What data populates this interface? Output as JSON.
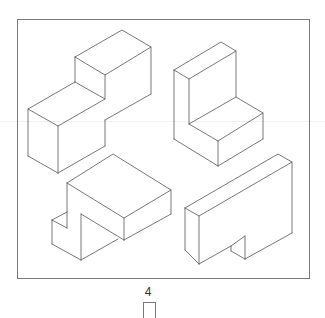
{
  "figure": {
    "label": "4",
    "line_color": "#555555",
    "frame_color": "#7a7a7a"
  },
  "shapes": [
    {
      "name": "stepped-block",
      "position": "top-left"
    },
    {
      "name": "l-bracket",
      "position": "top-right"
    },
    {
      "name": "notched-overhang-block",
      "position": "bottom-left"
    },
    {
      "name": "slotted-slab",
      "position": "bottom-right"
    }
  ],
  "answer_box": {
    "value": ""
  }
}
